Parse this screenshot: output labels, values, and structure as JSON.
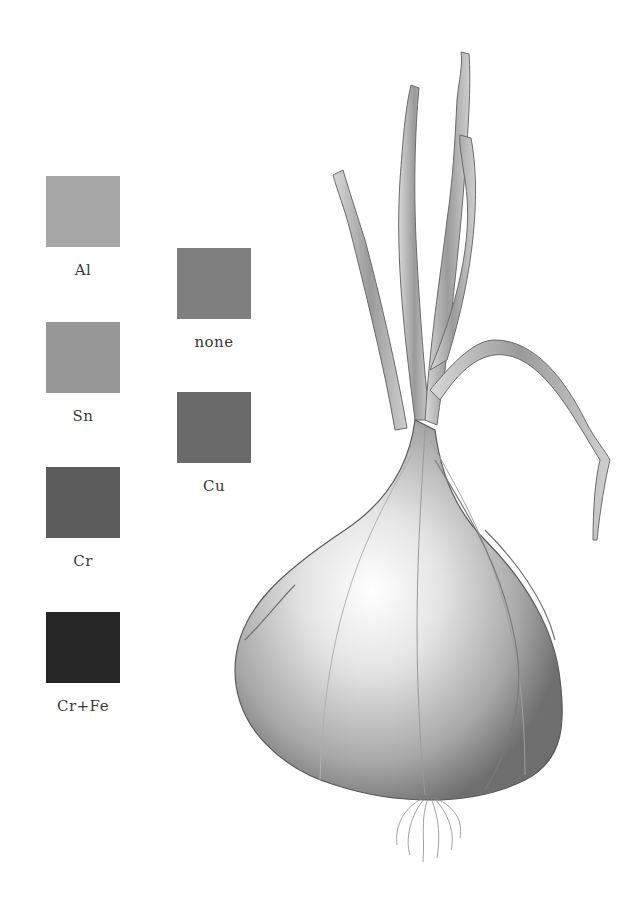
{
  "swatches": [
    {
      "id": "al",
      "label": "Al",
      "color": "#a6a6a6",
      "x": 46,
      "y": 176
    },
    {
      "id": "sn",
      "label": "Sn",
      "color": "#979797",
      "x": 46,
      "y": 322
    },
    {
      "id": "cr",
      "label": "Cr",
      "color": "#5c5c5c",
      "x": 46,
      "y": 467
    },
    {
      "id": "crfe",
      "label": "Cr+Fe",
      "color": "#262626",
      "x": 46,
      "y": 612
    },
    {
      "id": "none",
      "label": "none",
      "color": "#7f7f7f",
      "x": 177,
      "y": 248
    },
    {
      "id": "cu",
      "label": "Cu",
      "color": "#6a6a6a",
      "x": 177,
      "y": 392
    }
  ],
  "illustration": {
    "subject": "onion-pencil-drawing"
  }
}
